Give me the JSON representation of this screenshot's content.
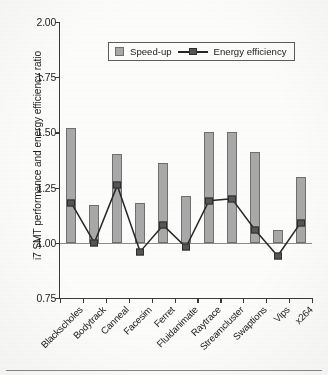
{
  "chart_data": {
    "type": "bar",
    "title": "",
    "xlabel": "",
    "ylabel": "i7 SMT performance and energy efficiency ratio",
    "ylim": [
      0.75,
      2.0
    ],
    "ytick_values": [
      2.0,
      1.75,
      1.5,
      1.25,
      1.0,
      0.75
    ],
    "ytick_labels": [
      "2.00",
      "1.75",
      "1.50",
      "1.25",
      "1.00",
      "0.75"
    ],
    "grid": false,
    "reference_line": 1.0,
    "legend_position": "top-center",
    "categories": [
      "Blackscholes",
      "Bodytrack",
      "Canneal",
      "Facesim",
      "Ferret",
      "Fluidanimate",
      "Raytrace",
      "Streamcluster",
      "Swaptions",
      "Vips",
      "x264"
    ],
    "series": [
      {
        "name": "Speed-up",
        "type": "bar",
        "color": "#a9a9a9",
        "values": [
          1.52,
          1.17,
          1.4,
          1.18,
          1.36,
          1.21,
          1.5,
          1.5,
          1.41,
          1.06,
          1.3
        ]
      },
      {
        "name": "Energy efficiency",
        "type": "line",
        "color": "#555555",
        "values": [
          1.18,
          1.0,
          1.26,
          0.96,
          1.08,
          0.98,
          1.19,
          1.2,
          1.06,
          0.94,
          1.09
        ]
      }
    ]
  },
  "legend": {
    "speedup_label": "Speed-up",
    "energy_label": "Energy efficiency"
  }
}
